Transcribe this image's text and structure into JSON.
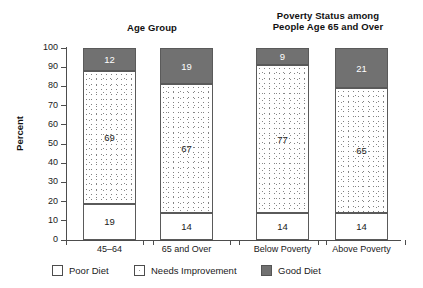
{
  "titles": {
    "left": "Age Group",
    "right_line1": "Poverty Status among",
    "right_line2": "People Age 65 and Over"
  },
  "axis": {
    "y_title": "Percent"
  },
  "legend": {
    "items": [
      {
        "label": "Poor Diet",
        "swatch": "white-box",
        "color": "#ffffff"
      },
      {
        "label": "Needs Improvement",
        "swatch": "dotted-box",
        "color": "#ffffff"
      },
      {
        "label": "Good Diet",
        "swatch": "gray-box",
        "color": "#717171"
      }
    ]
  },
  "chart_data": {
    "type": "bar",
    "subtitle": "",
    "xlabel": "",
    "ylabel": "Percent",
    "ylim": [
      0,
      100
    ],
    "yticks": [
      0,
      10,
      20,
      30,
      40,
      50,
      60,
      70,
      80,
      90,
      100
    ],
    "ytick_labels": [
      "0",
      "10",
      "20",
      "30",
      "40",
      "50",
      "60",
      "70",
      "80",
      "90",
      "100"
    ],
    "grid": false,
    "stacked": true,
    "legend_position": "bottom",
    "categories": [
      "45–64",
      "65 and Over",
      "Below Poverty",
      "Above Poverty"
    ],
    "series": [
      {
        "name": "Poor Diet",
        "values": [
          19,
          14,
          14,
          14
        ]
      },
      {
        "name": "Needs Improvement",
        "values": [
          69,
          67,
          77,
          65
        ]
      },
      {
        "name": "Good Diet",
        "values": [
          12,
          19,
          9,
          21
        ]
      }
    ],
    "groups": [
      {
        "title": "Age Group",
        "categories": [
          "45–64",
          "65 and Over"
        ]
      },
      {
        "title": "Poverty Status among People Age 65 and Over",
        "categories": [
          "Below Poverty",
          "Above Poverty"
        ]
      }
    ],
    "bars": [
      {
        "category": "45–64",
        "poor": 19,
        "needs": 69,
        "good": 12
      },
      {
        "category": "65 and Over",
        "poor": 14,
        "needs": 67,
        "good": 19
      },
      {
        "category": "Below Poverty",
        "poor": 14,
        "needs": 77,
        "good": 9
      },
      {
        "category": "Above Poverty",
        "poor": 14,
        "needs": 65,
        "good": 21
      }
    ]
  }
}
